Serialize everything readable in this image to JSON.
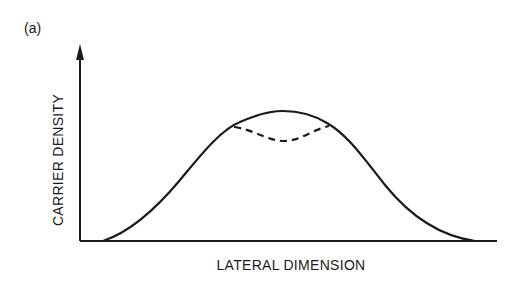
{
  "figure": {
    "panel_label": "(a)",
    "y_axis_label": "CARRIER DENSITY",
    "x_axis_label": "LATERAL DIMENSION",
    "colors": {
      "background": "#ffffff",
      "ink": "#1a1a1a"
    },
    "curves": [
      {
        "name": "carrier-density-profile",
        "style": "solid",
        "shape": "bell"
      },
      {
        "name": "carrier-density-dip",
        "style": "dashed",
        "shape": "central-depression"
      }
    ]
  }
}
